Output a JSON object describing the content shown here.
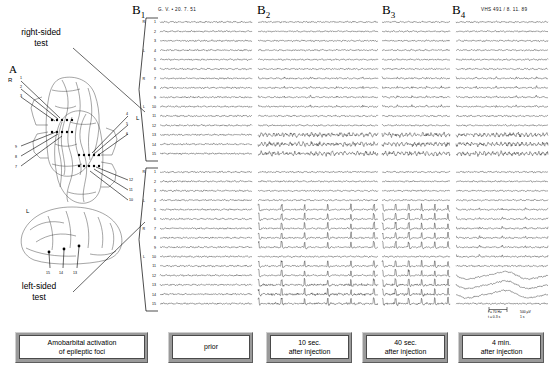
{
  "figure": {
    "panel_a_label": "A",
    "right_test_label": "right-sided\ntest",
    "left_test_label": "left-sided\ntest"
  },
  "brain_diagrams": {
    "axial_right": {
      "side_label": "R",
      "electrode_numbers": [
        "1",
        "2",
        "3",
        "9",
        "8",
        "7"
      ]
    },
    "axial_left": {
      "side_label": "L",
      "electrode_numbers": [
        "4",
        "5",
        "6",
        "12",
        "11",
        "10"
      ]
    },
    "lateral_left": {
      "side_label": "L",
      "electrode_numbers": [
        "15",
        "14",
        "13"
      ]
    }
  },
  "eeg_panels": [
    {
      "id": "B1",
      "label": "B",
      "subscript": "1",
      "meta": "G. V.  •  20. 7. 51",
      "caption_line1": "prior",
      "caption_line2": "",
      "activity": "baseline"
    },
    {
      "id": "B2",
      "label": "B",
      "subscript": "2",
      "meta": "",
      "caption_line1": "10 sec.",
      "caption_line2": "after injection",
      "activity": "spikes"
    },
    {
      "id": "B3",
      "label": "B",
      "subscript": "3",
      "meta": "",
      "caption_line1": "40 sec.",
      "caption_line2": "after injection",
      "activity": "spikes"
    },
    {
      "id": "B4",
      "label": "B",
      "subscript": "4",
      "meta": "VHS 491 / 8. 11. 89",
      "caption_line1": "4 min.",
      "caption_line2": "after injection",
      "activity": "slow-waves"
    }
  ],
  "channels": [
    {
      "side": "R",
      "num": "1"
    },
    {
      "side": "",
      "num": "2"
    },
    {
      "side": "",
      "num": "3"
    },
    {
      "side": "L",
      "num": "4"
    },
    {
      "side": "",
      "num": "5"
    },
    {
      "side": "",
      "num": "6"
    },
    {
      "side": "R",
      "num": "7"
    },
    {
      "side": "",
      "num": "8"
    },
    {
      "side": "",
      "num": "9"
    },
    {
      "side": "L",
      "num": "10"
    },
    {
      "side": "",
      "num": "11"
    },
    {
      "side": "",
      "num": "12"
    },
    {
      "side": "",
      "num": "13"
    },
    {
      "side": "",
      "num": "14"
    },
    {
      "side": "",
      "num": "15"
    }
  ],
  "calibration": {
    "filter_high": "f = 70 Hz",
    "filter_low": "t = 0.3 s",
    "amplitude": "500 µV",
    "time": "1 s"
  },
  "captions": {
    "main": "Amobarbital activation\nof epileptic foci",
    "prior": "prior",
    "t10": "10 sec.\nafter injection",
    "t40": "40 sec.\nafter injection",
    "t4min": "4 min.\nafter injection"
  }
}
